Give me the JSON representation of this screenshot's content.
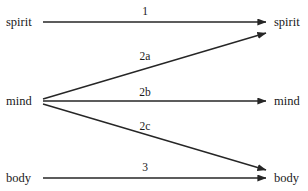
{
  "diagram": {
    "line_color": "#262626",
    "text_color": "#1a1a1a",
    "background": "#ffffff",
    "nodes_left": [
      {
        "id": "spirit-left",
        "label": "spirit"
      },
      {
        "id": "mind-left",
        "label": "mind"
      },
      {
        "id": "body-left",
        "label": "body"
      }
    ],
    "nodes_right": [
      {
        "id": "spirit-right",
        "label": "spirit"
      },
      {
        "id": "mind-right",
        "label": "mind"
      },
      {
        "id": "body-right",
        "label": "body"
      }
    ],
    "edges": [
      {
        "id": "edge-1",
        "label": "1",
        "from": "spirit-left",
        "to": "spirit-right",
        "style": "horizontal"
      },
      {
        "id": "edge-2a",
        "label": "2a",
        "from": "mind-left",
        "to": "spirit-right",
        "style": "diagonal-up"
      },
      {
        "id": "edge-2b",
        "label": "2b",
        "from": "mind-left",
        "to": "mind-right",
        "style": "horizontal"
      },
      {
        "id": "edge-2c",
        "label": "2c",
        "from": "mind-left",
        "to": "body-right",
        "style": "diagonal-down"
      },
      {
        "id": "edge-3",
        "label": "3",
        "from": "body-left",
        "to": "body-right",
        "style": "horizontal"
      }
    ]
  }
}
